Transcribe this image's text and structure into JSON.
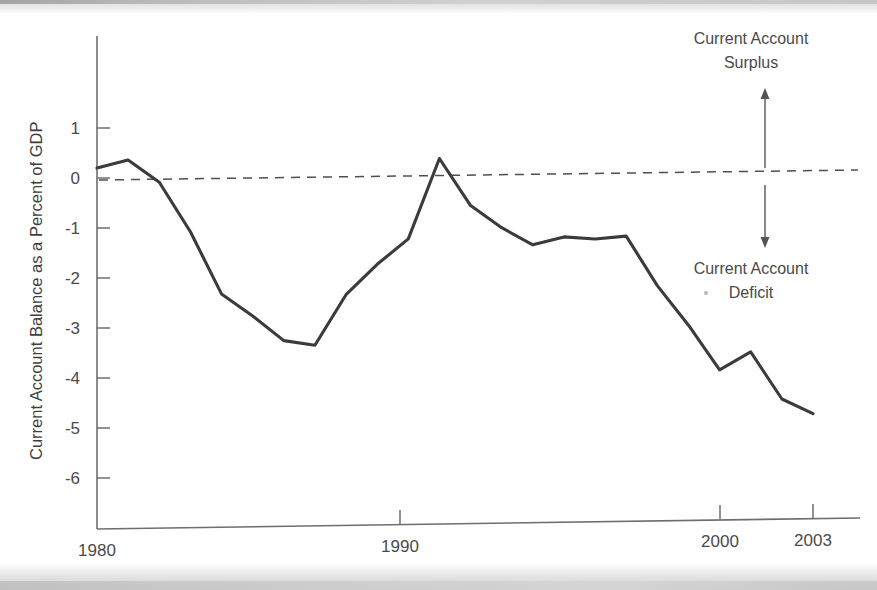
{
  "figure": {
    "y_axis_title": "Current Account Balance as a Percent of GDP",
    "annotations": {
      "surplus_line1": "Current Account",
      "surplus_line2": "Surplus",
      "deficit_line1": "Current Account",
      "deficit_line2": "Deficit",
      "up_arrow_icon": "up-arrow-icon",
      "down_arrow_icon": "down-arrow-icon"
    },
    "colors": {
      "line": "#3b3b3b",
      "axis": "#6e6e6e",
      "text": "#4a4a4a",
      "zero_dash": "#4f4f4f",
      "background": "#ffffff"
    }
  },
  "chart_data": {
    "type": "line",
    "title": "",
    "xlabel": "",
    "ylabel": "Current Account Balance as a Percent of GDP",
    "xlim": [
      1980,
      2003
    ],
    "ylim": [
      -6.6,
      1.6
    ],
    "grid": false,
    "legend": "none",
    "zero_reference_line": 0,
    "x_tick_labels": [
      "1980",
      "1990",
      "2000",
      "2003"
    ],
    "x_ticks": [
      1980,
      1990,
      2000,
      2003
    ],
    "y_tick_labels": [
      "1",
      "0",
      "-1",
      "-2",
      "-3",
      "-4",
      "-5",
      "-6"
    ],
    "y_ticks": [
      1,
      0,
      -1,
      -2,
      -3,
      -4,
      -5,
      -6
    ],
    "x": [
      1980,
      1981,
      1982,
      1983,
      1984,
      1985,
      1986,
      1987,
      1988,
      1989,
      1990,
      1991,
      1992,
      1993,
      1994,
      1995,
      1996,
      1997,
      1998,
      1999,
      2000,
      2001,
      2002,
      2003
    ],
    "values": [
      0.2,
      0.35,
      -0.1,
      -1.1,
      -2.35,
      -2.8,
      -3.3,
      -3.4,
      -2.4,
      -1.8,
      -1.3,
      0.3,
      -0.65,
      -1.1,
      -1.45,
      -1.3,
      -1.35,
      -1.3,
      -2.3,
      -3.1,
      -4.0,
      -3.65,
      -4.6,
      -4.9
    ],
    "series": [
      {
        "name": "Current Account Balance as a Percent of GDP",
        "values": [
          0.2,
          0.35,
          -0.1,
          -1.1,
          -2.35,
          -2.8,
          -3.3,
          -3.4,
          -2.4,
          -1.8,
          -1.3,
          0.3,
          -0.65,
          -1.1,
          -1.45,
          -1.3,
          -1.35,
          -1.3,
          -2.3,
          -3.1,
          -4.0,
          -3.65,
          -4.6,
          -4.9
        ]
      }
    ],
    "annotations": [
      {
        "text": "Current Account Surplus",
        "position": "upper-right",
        "arrow": "up"
      },
      {
        "text": "Current Account Deficit",
        "position": "lower-right",
        "arrow": "down"
      }
    ]
  }
}
